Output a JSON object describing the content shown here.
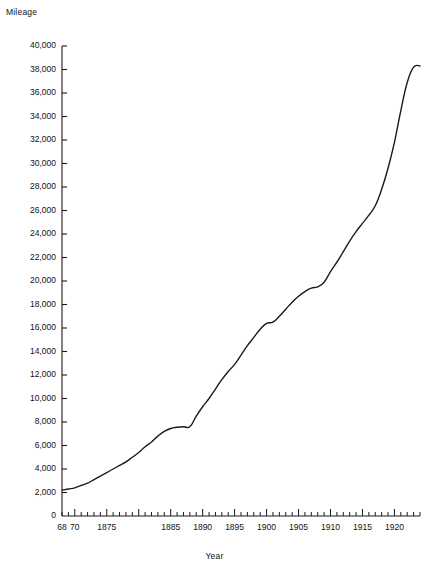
{
  "chart_data": {
    "type": "line",
    "title": "",
    "ylabel": "Mileage",
    "xlabel": "Year",
    "xlim": [
      1868,
      1924
    ],
    "ylim": [
      0,
      40000
    ],
    "grid": false,
    "legend": null,
    "y_ticks": [
      0,
      2000,
      4000,
      6000,
      8000,
      10000,
      12000,
      14000,
      16000,
      18000,
      20000,
      22000,
      24000,
      26000,
      28000,
      30000,
      32000,
      34000,
      36000,
      38000,
      40000
    ],
    "y_tick_labels": [
      "0",
      "2,000",
      "4,000",
      "6,000",
      "8,000",
      "10,000",
      "12,000",
      "14,000",
      "16,000",
      "18,000",
      "20,000",
      "22,000",
      "24,000",
      "26,000",
      "28,000",
      "30,000",
      "32,000",
      "34,000",
      "36,000",
      "38,000",
      "40,000"
    ],
    "x_major_ticks": [
      1870,
      1875,
      1880,
      1885,
      1890,
      1895,
      1900,
      1905,
      1910,
      1915,
      1920
    ],
    "x_tick_labels": [
      {
        "value": 1868,
        "label": "68"
      },
      {
        "value": 1870,
        "label": "70"
      },
      {
        "value": 1875,
        "label": "1875"
      },
      {
        "value": 1885,
        "label": "1885"
      },
      {
        "value": 1890,
        "label": "1890"
      },
      {
        "value": 1895,
        "label": "1895"
      },
      {
        "value": 1900,
        "label": "1900"
      },
      {
        "value": 1905,
        "label": "1905"
      },
      {
        "value": 1910,
        "label": "1910"
      },
      {
        "value": 1915,
        "label": "1915"
      },
      {
        "value": 1920,
        "label": "1920"
      }
    ],
    "x_minor_tick_interval": 1,
    "line_color": "#1a1a1a",
    "line_width": 1.4,
    "x": [
      1868,
      1869,
      1870,
      1871,
      1872,
      1873,
      1874,
      1875,
      1876,
      1877,
      1878,
      1879,
      1880,
      1881,
      1882,
      1883,
      1884,
      1885,
      1886,
      1887,
      1888,
      1889,
      1890,
      1891,
      1892,
      1893,
      1894,
      1895,
      1896,
      1897,
      1898,
      1899,
      1900,
      1901,
      1902,
      1903,
      1904,
      1905,
      1906,
      1907,
      1908,
      1909,
      1910,
      1911,
      1912,
      1913,
      1914,
      1915,
      1916,
      1917,
      1918,
      1919,
      1920,
      1921,
      1922,
      1923,
      1924
    ],
    "values": [
      2200,
      2300,
      2400,
      2600,
      2800,
      3100,
      3400,
      3700,
      4000,
      4300,
      4600,
      5000,
      5400,
      5900,
      6300,
      6800,
      7200,
      7450,
      7550,
      7600,
      7600,
      8500,
      9300,
      10000,
      10800,
      11600,
      12300,
      12900,
      13700,
      14500,
      15200,
      15900,
      16400,
      16500,
      17000,
      17600,
      18200,
      18700,
      19100,
      19400,
      19500,
      19900,
      20800,
      21600,
      22500,
      23400,
      24200,
      24900,
      25600,
      26400,
      27800,
      29600,
      31800,
      34500,
      36900,
      38200,
      38300
    ]
  },
  "axis_geometry": {
    "plot_left": 62,
    "plot_right": 420,
    "plot_top": 46,
    "plot_bottom": 516
  }
}
